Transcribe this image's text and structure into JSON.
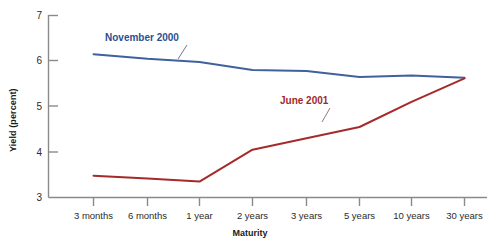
{
  "chart_data": {
    "type": "line",
    "title": "",
    "xlabel": "Maturity",
    "ylabel": "Yield (percent)",
    "categories": [
      "3 months",
      "6 months",
      "1 year",
      "2 years",
      "3 years",
      "5 years",
      "10 years",
      "30 years"
    ],
    "ylim": [
      3,
      7
    ],
    "yticks": [
      3,
      4,
      5,
      6,
      7
    ],
    "ytick_labels": [
      "3",
      "4",
      "5",
      "6",
      "7"
    ],
    "grid": false,
    "legend": "inline-annotations",
    "series": [
      {
        "name": "November 2000",
        "color": "#41619c",
        "label_color": "#2d4f91",
        "values": [
          6.15,
          6.05,
          5.98,
          5.8,
          5.78,
          5.65,
          5.68,
          5.63
        ]
      },
      {
        "name": "June 2001",
        "color": "#a52a2a",
        "label_color": "#9e2b2b",
        "values": [
          3.48,
          3.42,
          3.35,
          4.05,
          4.3,
          4.55,
          5.1,
          5.62
        ]
      }
    ],
    "annotations": [
      {
        "text": "November 2000",
        "series": "November 2000"
      },
      {
        "text": "June 2001",
        "series": "June 2001"
      }
    ]
  },
  "axis": {
    "y_title": "Yield (percent)",
    "x_title": "Maturity",
    "y_tick_0": "3",
    "y_tick_1": "4",
    "y_tick_2": "5",
    "y_tick_3": "6",
    "y_tick_4": "7",
    "x_tick_0": "3 months",
    "x_tick_1": "6 months",
    "x_tick_2": "1 year",
    "x_tick_3": "2 years",
    "x_tick_4": "3 years",
    "x_tick_5": "5 years",
    "x_tick_6": "10 years",
    "x_tick_7": "30 years"
  },
  "labels": {
    "november": "November 2000",
    "june": "June 2001"
  }
}
